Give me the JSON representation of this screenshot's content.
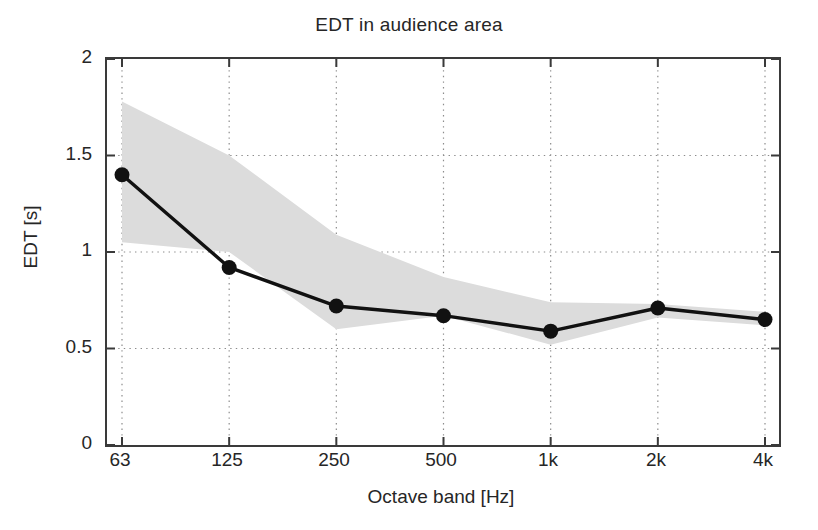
{
  "chart_data": {
    "type": "line",
    "title": "EDT in audience area",
    "xlabel": "Octave band [Hz]",
    "ylabel": "EDT [s]",
    "categories": [
      "63",
      "125",
      "250",
      "500",
      "1k",
      "2k",
      "4k"
    ],
    "xtick_labels": [
      "63",
      "125",
      "250",
      "500",
      "1k",
      "2k",
      "4k"
    ],
    "ytick_labels": [
      "0",
      "0.5",
      "1",
      "1.5",
      "2"
    ],
    "ytick_values": [
      0,
      0.5,
      1,
      1.5,
      2
    ],
    "ylim": [
      0,
      2
    ],
    "grid": "dotted",
    "legend": "none",
    "series": [
      {
        "name": "EDT mean",
        "marker": "filled-circle",
        "color": "#111111",
        "values": [
          1.4,
          0.92,
          0.72,
          0.67,
          0.59,
          0.71,
          0.65
        ]
      }
    ],
    "band": {
      "name": "spatial spread (min-max)",
      "color": "#dcdcdc",
      "upper": [
        1.78,
        1.5,
        1.09,
        0.87,
        0.74,
        0.73,
        0.69
      ],
      "lower": [
        1.05,
        1.0,
        0.6,
        0.67,
        0.52,
        0.66,
        0.62
      ]
    }
  },
  "axis": {
    "ytick_labels": [
      "2",
      "1.5",
      "1",
      "0.5",
      "0"
    ],
    "xtick_labels": [
      "63",
      "125",
      "250",
      "500",
      "1k",
      "2k",
      "4k"
    ]
  },
  "colors": {
    "line": "#111111",
    "band": "#dcdcdc",
    "grid": "#8c8c8c",
    "frame": "#3a3a3a",
    "background": "#ffffff",
    "text": "#262626"
  }
}
